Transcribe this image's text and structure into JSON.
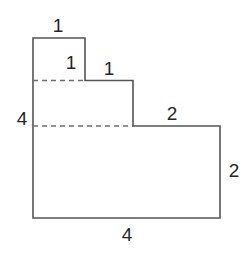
{
  "figure": {
    "kind": "geometry-diagram",
    "background_color": "#ffffff",
    "outline_color": "#545454",
    "dashed_color": "#6e6e6e",
    "label_color": "#262626",
    "outline_width": 1.6,
    "dashed_width": 1.4,
    "dash_pattern": "5,4",
    "outline_path": "M 33 38 L 85 38 L 85 80.5 L 133 80.5 L 133 126 L 220 126 L 220 218 L 33 218 Z",
    "dashed_segments": [
      {
        "name": "upper-division-line",
        "x1": 33,
        "y1": 80.5,
        "x2": 85,
        "y2": 80.5
      },
      {
        "name": "lower-division-line",
        "x1": 33,
        "y1": 126,
        "x2": 133,
        "y2": 126
      }
    ],
    "labels": [
      {
        "name": "top-width-label",
        "text": "1",
        "x": 58,
        "y": 25
      },
      {
        "name": "first-step-height-label",
        "text": "1",
        "x": 71,
        "y": 62
      },
      {
        "name": "second-step-width-label",
        "text": "1",
        "x": 109,
        "y": 68
      },
      {
        "name": "left-height-label",
        "text": "4",
        "x": 22,
        "y": 118
      },
      {
        "name": "upper-right-width-label",
        "text": "2",
        "x": 172,
        "y": 113
      },
      {
        "name": "right-height-label",
        "text": "2",
        "x": 234,
        "y": 170
      },
      {
        "name": "bottom-width-label",
        "text": "4",
        "x": 127,
        "y": 234
      }
    ]
  },
  "chart_data": {
    "type": "diagram",
    "title": "",
    "shape": "staircase-polygon",
    "vertices": [
      [
        0,
        4
      ],
      [
        1,
        4
      ],
      [
        1,
        3
      ],
      [
        2,
        3
      ],
      [
        2,
        2
      ],
      [
        4,
        2
      ],
      [
        4,
        0
      ],
      [
        0,
        0
      ]
    ],
    "dimension_labels": [
      "1",
      "1",
      "1",
      "4",
      "2",
      "2",
      "4"
    ],
    "units": "",
    "grid": false,
    "legend": "none"
  }
}
